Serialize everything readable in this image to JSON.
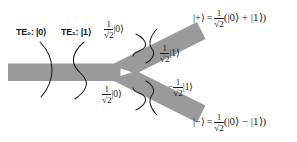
{
  "figure": {
    "name": "photonic-y-junction-mode-converter",
    "background_color": "#ffffff",
    "waveguide_color": "#9a9a9a",
    "mode_curve_color": "#1a1a1a",
    "text_color": "#1a1a1a"
  },
  "input_labels": [
    {
      "mode": "TE",
      "subscript": "0",
      "separator": ":",
      "state": "|0⟩",
      "full": "TE₀: |0⟩"
    },
    {
      "mode": "TE",
      "subscript": "1",
      "separator": ":",
      "state": "|1⟩",
      "full": "TE₁: |1⟩"
    }
  ],
  "branch_labels": {
    "upper_outer": {
      "sign": "",
      "numerator": "1",
      "denominator": "√2",
      "ket": "|0⟩",
      "full": "1/√2 |0⟩"
    },
    "upper_inner": {
      "sign": "",
      "numerator": "1",
      "denominator": "√2",
      "ket": "|1⟩",
      "full": "1/√2 |1⟩"
    },
    "lower_outer": {
      "sign": "",
      "numerator": "1",
      "denominator": "√2",
      "ket": "|0⟩",
      "full": "1/√2 |0⟩"
    },
    "lower_inner": {
      "sign": "−",
      "numerator": "1",
      "denominator": "√2",
      "ket": "|1⟩",
      "full": "−1/√2 |1⟩"
    }
  },
  "equations": {
    "plus": {
      "lhs": "|+⟩",
      "equals": "=",
      "numerator": "1",
      "denominator": "√2",
      "body": "(|0⟩ + |1⟩)",
      "full": "|+⟩ = 1/√2 (|0⟩ + |1⟩)"
    },
    "minus": {
      "lhs": "|−⟩",
      "equals": "=",
      "numerator": "1",
      "denominator": "√2",
      "body": "(|0⟩ − |1⟩)",
      "full": "|−⟩ = 1/√2 (|0⟩ − |1⟩)"
    }
  },
  "geometry": {
    "input_waveguide": {
      "x": 8,
      "y": 64,
      "width": 112,
      "height": 17
    },
    "upper_arm_angle_deg": -27,
    "lower_arm_angle_deg": 27,
    "junction": {
      "x": 118,
      "y": 72
    }
  }
}
